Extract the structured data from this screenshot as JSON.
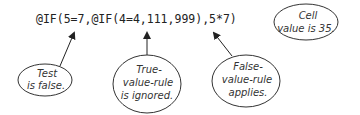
{
  "formula": "@IF(5=7,@IF(4=4,111,999),5*7)",
  "callouts": [
    {
      "id": "test",
      "lines": [
        "Test",
        "is false."
      ]
    },
    {
      "id": "true-value-rule",
      "lines": [
        "True-",
        "value-rule",
        "is ignored."
      ]
    },
    {
      "id": "false-value-rule",
      "lines": [
        "False-",
        "value-rule",
        "applies."
      ]
    },
    {
      "id": "cell-value",
      "lines": [
        "Cell",
        "value is 35."
      ]
    }
  ]
}
